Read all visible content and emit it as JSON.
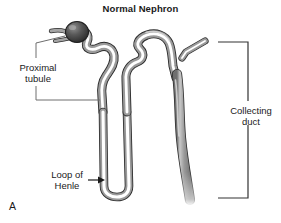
{
  "figure": {
    "title": "Normal Nephron",
    "panel_letter": "A",
    "background_color": "#ffffff",
    "text_color": "#1a1a1a",
    "tubule_wall_color": "#9a9a9a",
    "tubule_outline_color": "#2b2b2b",
    "tubule_lumen_color": "#ffffff",
    "glomerulus_color": "#4a4a4a",
    "leader_line_color": "#6e6e6e",
    "bracket_color": "#333333"
  },
  "labels": {
    "proximal_tubule": "Proximal\ntubule",
    "collecting_duct": "Collecting\nduct",
    "loop_of_henle": "Loop of\nHenle"
  },
  "anatomy": {
    "structures": [
      "glomerulus",
      "proximal-convoluted-tubule",
      "loop-of-henle",
      "distal-convoluted-tubule",
      "collecting-duct"
    ]
  },
  "annotations": {
    "proximal_leader_upper": "line from label up-right to glomerulus",
    "proximal_leader_lower": "elbow line from label down then right to proximal tubule",
    "loop_arrow": "arrow pointing right to loop of Henle bend",
    "collecting_bracket": "square bracket spanning the collecting duct"
  }
}
